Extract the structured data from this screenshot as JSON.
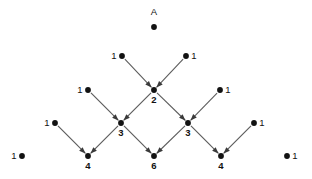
{
  "diagram": {
    "title_label": "A",
    "canvas": {
      "width": 312,
      "height": 179,
      "background": "#ffffff"
    },
    "colors": {
      "node": "#121212",
      "edge": "#5c5c5c",
      "arrow": "#3a3a3a",
      "text": "#111111"
    },
    "apex": {
      "label": "A",
      "label_x": 154,
      "label_y": 15,
      "dot_x": 154,
      "dot_y": 27,
      "value": ""
    },
    "nodes": [
      {
        "id": "r2-left-1",
        "value": "1",
        "x": 122,
        "y": 56,
        "label_pos": "left",
        "bold": false,
        "isolated": false
      },
      {
        "id": "r2-right-1",
        "value": "1",
        "x": 186,
        "y": 56,
        "label_pos": "right",
        "bold": false,
        "isolated": false
      },
      {
        "id": "r2-center-2",
        "value": "2",
        "x": 154,
        "y": 90,
        "label_pos": "below",
        "bold": true,
        "isolated": false
      },
      {
        "id": "r3-left-1",
        "value": "1",
        "x": 88,
        "y": 90,
        "label_pos": "left",
        "bold": false,
        "isolated": false
      },
      {
        "id": "r3-right-1",
        "value": "1",
        "x": 220,
        "y": 90,
        "label_pos": "right",
        "bold": false,
        "isolated": false
      },
      {
        "id": "r3-left-3",
        "value": "3",
        "x": 121,
        "y": 123,
        "label_pos": "below",
        "bold": true,
        "isolated": false
      },
      {
        "id": "r3-right-3",
        "value": "3",
        "x": 188,
        "y": 123,
        "label_pos": "below",
        "bold": true,
        "isolated": false
      },
      {
        "id": "r4-left-1",
        "value": "1",
        "x": 55,
        "y": 123,
        "label_pos": "left",
        "bold": false,
        "isolated": false
      },
      {
        "id": "r4-right-1",
        "value": "1",
        "x": 254,
        "y": 123,
        "label_pos": "right",
        "bold": false,
        "isolated": false
      },
      {
        "id": "r5-left-4",
        "value": "4",
        "x": 88,
        "y": 156,
        "label_pos": "below",
        "bold": true,
        "isolated": false
      },
      {
        "id": "r5-center-6",
        "value": "6",
        "x": 154,
        "y": 156,
        "label_pos": "below",
        "bold": true,
        "isolated": false
      },
      {
        "id": "r5-right-4",
        "value": "4",
        "x": 221,
        "y": 156,
        "label_pos": "below",
        "bold": true,
        "isolated": false
      },
      {
        "id": "r5-far-left-1",
        "value": "1",
        "x": 22,
        "y": 156,
        "label_pos": "left",
        "bold": false,
        "isolated": true
      },
      {
        "id": "r5-far-right-1",
        "value": "1",
        "x": 287,
        "y": 156,
        "label_pos": "right",
        "bold": false,
        "isolated": true
      }
    ],
    "edges": [
      {
        "from": "r2-left-1",
        "to": "r2-center-2"
      },
      {
        "from": "r2-right-1",
        "to": "r2-center-2"
      },
      {
        "from": "r3-left-1",
        "to": "r3-left-3"
      },
      {
        "from": "r2-center-2",
        "to": "r3-left-3"
      },
      {
        "from": "r2-center-2",
        "to": "r3-right-3"
      },
      {
        "from": "r3-right-1",
        "to": "r3-right-3"
      },
      {
        "from": "r4-left-1",
        "to": "r5-left-4"
      },
      {
        "from": "r3-left-3",
        "to": "r5-left-4"
      },
      {
        "from": "r3-left-3",
        "to": "r5-center-6"
      },
      {
        "from": "r3-right-3",
        "to": "r5-center-6"
      },
      {
        "from": "r3-right-3",
        "to": "r5-right-4"
      },
      {
        "from": "r4-right-1",
        "to": "r5-right-4"
      }
    ]
  }
}
